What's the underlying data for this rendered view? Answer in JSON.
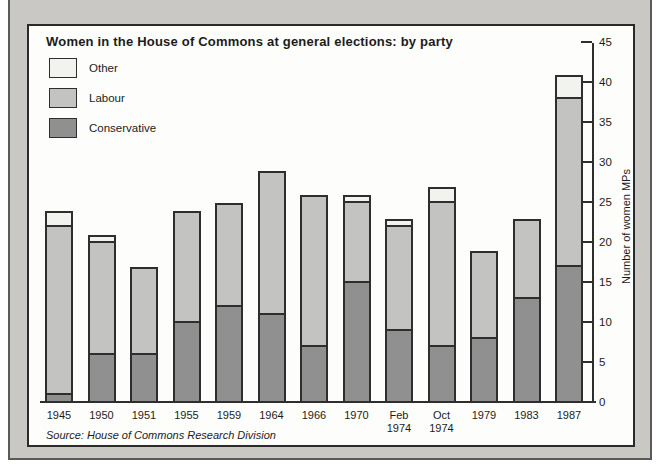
{
  "title": "Women in the House of Commons at general elections: by party",
  "source": "Source: House of Commons Research Division",
  "legend": {
    "items": [
      {
        "label": "Other",
        "color": "#f2f2ee"
      },
      {
        "label": "Labour",
        "color": "#c3c3c1"
      },
      {
        "label": "Conservative",
        "color": "#909090"
      }
    ]
  },
  "y_axis": {
    "title": "Number of women MPs",
    "ticks": [
      0,
      5,
      10,
      15,
      20,
      25,
      30,
      35,
      40,
      45
    ],
    "max": 45
  },
  "colors": {
    "frame_background": "#c9c8c4",
    "panel_background": "#fdfdfb",
    "stroke": "#2e2e2e"
  },
  "chart_data": {
    "type": "bar",
    "stacked": true,
    "title": "Women in the House of Commons at general elections: by party",
    "xlabel": "",
    "ylabel": "Number of women MPs",
    "ylim": [
      0,
      45
    ],
    "legend_position": "top-left",
    "grid": false,
    "categories": [
      "1945",
      "1950",
      "1951",
      "1955",
      "1959",
      "1964",
      "1966",
      "1970",
      "Feb 1974",
      "Oct 1974",
      "1979",
      "1983",
      "1987"
    ],
    "series": [
      {
        "name": "Conservative",
        "color": "#909090",
        "values": [
          1,
          6,
          6,
          10,
          12,
          11,
          7,
          15,
          9,
          7,
          8,
          13,
          17
        ]
      },
      {
        "name": "Labour",
        "color": "#c3c3c1",
        "values": [
          21,
          14,
          11,
          14,
          13,
          18,
          19,
          10,
          13,
          18,
          11,
          10,
          21
        ]
      },
      {
        "name": "Other",
        "color": "#f2f2ee",
        "values": [
          2,
          1,
          0,
          0,
          0,
          0,
          0,
          1,
          1,
          2,
          0,
          0,
          3
        ]
      }
    ],
    "totals": [
      24,
      21,
      17,
      24,
      25,
      29,
      26,
      26,
      23,
      27,
      19,
      23,
      41
    ]
  }
}
